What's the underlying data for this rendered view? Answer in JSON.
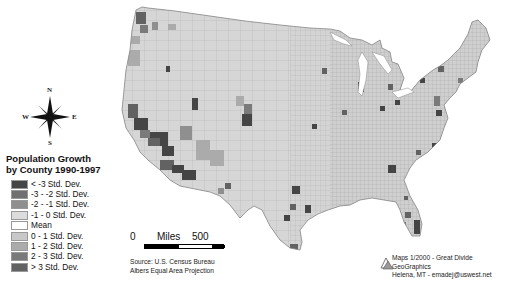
{
  "title": {
    "line1": "Population Growth",
    "line2": "by County 1990-1997"
  },
  "compass": {
    "n": "N",
    "s": "S",
    "e": "E",
    "w": "W"
  },
  "legend": {
    "items": [
      {
        "label": "< -3 Std. Dev.",
        "color": "#454545"
      },
      {
        "label": "-3 - -2 Std. Dev.",
        "color": "#707070"
      },
      {
        "label": "-2 - -1 Std. Dev.",
        "color": "#8f8f8f"
      },
      {
        "label": "-1 - 0 Std. Dev.",
        "color": "#dcdcdc"
      },
      {
        "label": "Mean",
        "color": "#ffffff"
      },
      {
        "label": "0 - 1 Std. Dev.",
        "color": "#c8c8c8"
      },
      {
        "label": "1 - 2 Std. Dev.",
        "color": "#ababab"
      },
      {
        "label": "2 - 3 Std. Dev.",
        "color": "#7a7a7a"
      },
      {
        "label": "> 3 Std. Dev.",
        "color": "#626262"
      }
    ]
  },
  "scale_bar": {
    "start": "0",
    "unit": "Miles",
    "end": "500"
  },
  "source": {
    "line1": "Source: U.S. Census Bureau",
    "line2": "Albers Equal Area Projection"
  },
  "credit": {
    "line1": "Maps 1/2000 - Great Divide GeoGraphics",
    "line2": "Helena, MT - emadej@uswest.net"
  },
  "map": {
    "base_color": "#d4d4d4",
    "border_color": "#9a9a9a"
  }
}
